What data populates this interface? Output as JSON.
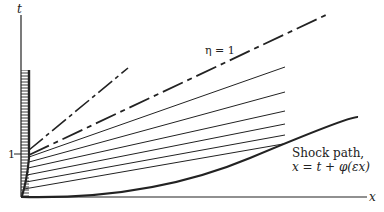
{
  "figure": {
    "axes": {
      "vertical_label": "t",
      "horizontal_label": "x",
      "tick_label": "1"
    },
    "annotations": {
      "eta_label": "η = 1",
      "shock_label_line1": "Shock path,",
      "shock_label_line2": "x = t + φ(εx)"
    },
    "colors": {
      "ink": "#222222",
      "background": "#ffffff"
    },
    "geometry": {
      "origin": [
        21,
        197
      ],
      "t_axis_top": [
        21,
        15
      ],
      "x_axis_end": [
        367,
        197
      ],
      "tick_one_y": 154,
      "hatch_region": {
        "x0": 21,
        "x1": 29,
        "y_top": 70,
        "y_bottom": 197
      },
      "steep_dashed_line": [
        [
          29,
          150
        ],
        [
          128,
          68
        ]
      ],
      "eta_one_line": [
        [
          29,
          155
        ],
        [
          328,
          14
        ]
      ],
      "fan_lines": [
        [
          [
            29,
            157
          ],
          [
            285,
            67
          ]
        ],
        [
          [
            29,
            162
          ],
          [
            285,
            92
          ]
        ],
        [
          [
            28,
            168
          ],
          [
            285,
            111
          ]
        ],
        [
          [
            27,
            175
          ],
          [
            285,
            124
          ]
        ],
        [
          [
            26,
            182
          ],
          [
            285,
            135
          ]
        ],
        [
          [
            24,
            189
          ],
          [
            283,
            144
          ]
        ]
      ],
      "shock_curve": "M21 197 Q 150 200 250 158 T 358 117"
    }
  }
}
